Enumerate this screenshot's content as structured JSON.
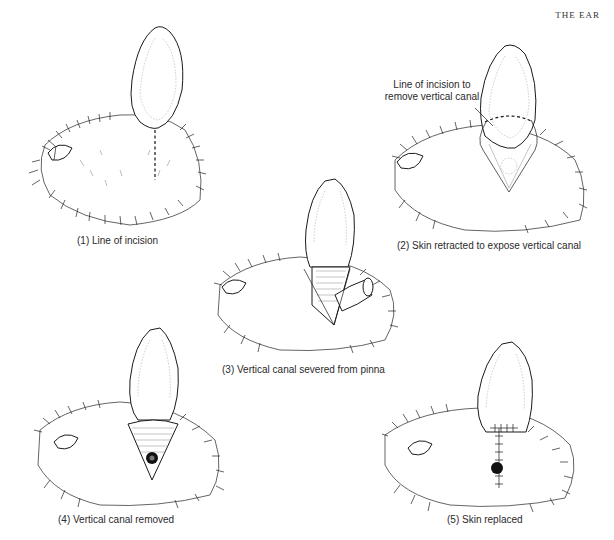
{
  "page": {
    "running_head": "THE EAR"
  },
  "figures": [
    {
      "id": 1,
      "caption": "(1) Line of incision"
    },
    {
      "id": 2,
      "caption": "(2) Skin retracted to expose vertical canal",
      "callout_line1": "Line of incision to",
      "callout_line2": "remove vertical canal"
    },
    {
      "id": 3,
      "caption": "(3) Vertical canal severed from pinna"
    },
    {
      "id": 4,
      "caption": "(4) Vertical canal removed"
    },
    {
      "id": 5,
      "caption": "(5) Skin replaced"
    }
  ]
}
